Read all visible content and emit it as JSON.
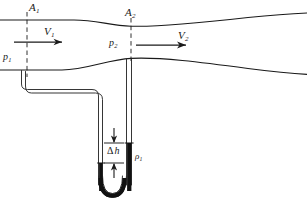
{
  "figure": {
    "type": "physics-diagram",
    "background_color": "#ffffff",
    "line_color": "#1a1a1a",
    "fluid_color": "#000000"
  },
  "labels": {
    "area_inlet": {
      "symbol": "A",
      "subscript": "1",
      "text": "A1"
    },
    "area_throat": {
      "symbol": "A",
      "subscript": "2",
      "text": "A2"
    },
    "velocity_inlet": {
      "symbol": "V",
      "subscript": "1",
      "text": "V1"
    },
    "velocity_throat": {
      "symbol": "V",
      "subscript": "2",
      "text": "V2"
    },
    "pressure_inlet": {
      "symbol": "p",
      "subscript": "1",
      "text": "p1"
    },
    "pressure_throat": {
      "symbol": "p",
      "subscript": "2",
      "text": "p2"
    },
    "height_difference": {
      "symbol": "h",
      "prefix": "Δ",
      "text": "Δ h"
    },
    "manometer_density": {
      "symbol": "ρ",
      "subscript": "1",
      "text": "ρ1"
    }
  },
  "geometry": {
    "pipe_top_inlet_y": 20,
    "pipe_bottom_inlet_y": 70,
    "throat_top_y": 26,
    "throat_bottom_y": 58,
    "throat_x": 131,
    "station1_x": 27,
    "manometer_left_leg_x": 101,
    "manometer_right_leg_x": 129,
    "fluid_level_left_y": 163,
    "fluid_level_right_y": 143
  },
  "annotations": {
    "station1_line": "dashed vertical section line at inlet",
    "station2_line": "dashed vertical section line at throat",
    "flow_direction": "left to right"
  }
}
